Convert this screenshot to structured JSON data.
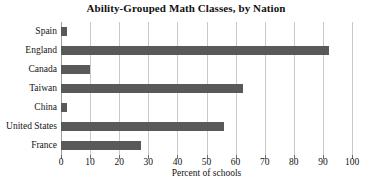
{
  "chart_data": {
    "type": "bar",
    "orientation": "horizontal",
    "title": "Ability-Grouped Math Classes, by Nation",
    "xlabel": "Percent of schools",
    "ylabel": "",
    "categories": [
      "Spain",
      "England",
      "Canada",
      "Taiwan",
      "China",
      "United States",
      "France"
    ],
    "values": [
      2,
      92,
      10,
      62.5,
      2,
      56,
      27.5
    ],
    "xlim": [
      0,
      100
    ],
    "xticks": [
      0,
      10,
      20,
      30,
      40,
      50,
      60,
      70,
      80,
      90,
      100
    ],
    "xtick_labels": [
      "0",
      "10",
      "20",
      "30",
      "40",
      "50",
      "60",
      "70",
      "80",
      "90",
      "100"
    ],
    "grid": "vertical",
    "legend": "none",
    "bar_color": "#595959",
    "grid_color": "#c9c9c9",
    "axis_color": "#9e9e9e",
    "background": "#ffffff"
  }
}
